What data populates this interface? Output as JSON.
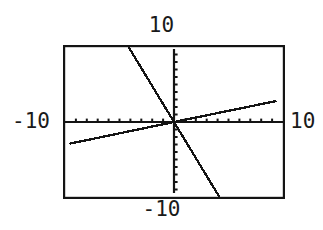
{
  "figure": {
    "kind": "graphing-calculator-viewport",
    "background_color": "#ffffff",
    "ink_color": "#141414"
  },
  "labels": {
    "top": "10",
    "bottom": "-10",
    "left": "-10",
    "right": "10"
  },
  "chart_data": {
    "type": "line",
    "title": "",
    "xlabel": "",
    "ylabel": "",
    "xlim": [
      -10,
      10
    ],
    "ylim": [
      -10,
      10
    ],
    "grid": false,
    "legend": "none",
    "axis_style": "crosshair-with-unit-tickmarks",
    "x_tick_interval": 1,
    "y_tick_interval": 1,
    "x_tick_labels": [
      "-10",
      "10"
    ],
    "y_tick_labels": [
      "-10",
      "10"
    ],
    "series": [
      {
        "name": "steep decreasing line",
        "type": "line",
        "slope": -2.4,
        "intercept": 0,
        "x": [
          -4.5,
          0,
          5
        ],
        "y": [
          10.8,
          0,
          -12
        ],
        "x_visible": [
          -4.5,
          5.0
        ],
        "y_visible": [
          10.0,
          -10.0
        ]
      },
      {
        "name": "shallow increasing line",
        "type": "line",
        "slope": 0.3,
        "intercept": 0,
        "x": [
          -9.6,
          0,
          9.4
        ],
        "y": [
          -2.9,
          0,
          2.8
        ],
        "x_visible": [
          -9.6,
          9.4
        ],
        "y_visible": [
          -2.9,
          2.8
        ]
      }
    ]
  }
}
